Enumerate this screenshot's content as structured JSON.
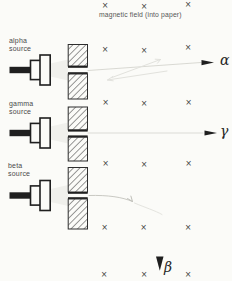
{
  "field": {
    "label": "magnetic field (into paper)",
    "symbol": "×",
    "marks": [
      [
        105,
        5
      ],
      [
        144,
        6
      ],
      [
        188,
        4
      ],
      [
        105,
        49
      ],
      [
        144,
        50
      ],
      [
        188,
        47
      ],
      [
        105.5,
        102
      ],
      [
        144,
        103
      ],
      [
        188.5,
        102
      ],
      [
        105.5,
        163
      ],
      [
        144,
        164
      ],
      [
        188.5,
        163
      ],
      [
        104.5,
        227
      ],
      [
        143.5,
        227
      ],
      [
        188,
        227
      ],
      [
        104,
        273.5
      ],
      [
        144,
        273.5
      ],
      [
        188,
        273.5
      ]
    ]
  },
  "sources": [
    {
      "id": "alpha",
      "label_top": "alpha",
      "label_bottom": "source",
      "symbol": "α"
    },
    {
      "id": "gamma",
      "label_top": "gamma",
      "label_bottom": "source",
      "symbol": "γ"
    },
    {
      "id": "beta",
      "label_top": "beta",
      "label_bottom": "source",
      "symbol": "β"
    }
  ],
  "colors": {
    "ink": "#2e2e2e",
    "label_gray": "#4a4a4a",
    "faint_path": "#d6d6d0",
    "background": "#fbfbf8"
  }
}
